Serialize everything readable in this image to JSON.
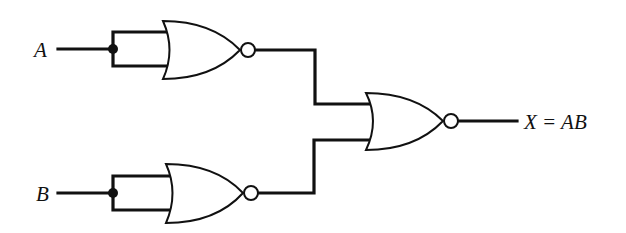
{
  "diagram": {
    "type": "logic-circuit",
    "inputs": [
      {
        "label": "A"
      },
      {
        "label": "B"
      }
    ],
    "output": {
      "label": "X = AB"
    },
    "gates": [
      {
        "id": "nor1",
        "type": "NOR",
        "inputs": [
          "A",
          "A"
        ],
        "role": "inverter"
      },
      {
        "id": "nor2",
        "type": "NOR",
        "inputs": [
          "B",
          "B"
        ],
        "role": "inverter"
      },
      {
        "id": "nor3",
        "type": "NOR",
        "inputs": [
          "nor1",
          "nor2"
        ],
        "role": "output"
      }
    ],
    "colors": {
      "ink": "#111111",
      "background": "#ffffff"
    }
  }
}
